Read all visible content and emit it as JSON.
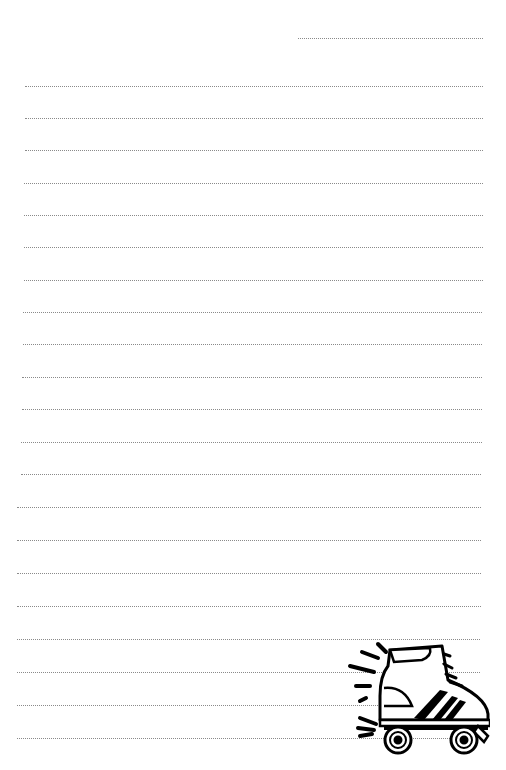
{
  "page": {
    "type": "lined-notepaper",
    "background": "#ffffff",
    "line_color": "#8a8a8a",
    "line_style": "dotted"
  },
  "header_line": {
    "x1": 298,
    "x2": 483,
    "y": 38
  },
  "lines": [
    {
      "y": 86,
      "x1": 25,
      "x2": 483
    },
    {
      "y": 118,
      "x1": 25,
      "x2": 483
    },
    {
      "y": 150,
      "x1": 25,
      "x2": 483
    },
    {
      "y": 183,
      "x1": 24,
      "x2": 483
    },
    {
      "y": 215,
      "x1": 24,
      "x2": 483
    },
    {
      "y": 247,
      "x1": 24,
      "x2": 483
    },
    {
      "y": 280,
      "x1": 24,
      "x2": 483
    },
    {
      "y": 312,
      "x1": 23,
      "x2": 482
    },
    {
      "y": 344,
      "x1": 23,
      "x2": 482
    },
    {
      "y": 377,
      "x1": 22,
      "x2": 482
    },
    {
      "y": 409,
      "x1": 22,
      "x2": 482
    },
    {
      "y": 442,
      "x1": 21,
      "x2": 482
    },
    {
      "y": 474,
      "x1": 21,
      "x2": 481
    },
    {
      "y": 507,
      "x1": 17,
      "x2": 481
    },
    {
      "y": 540,
      "x1": 17,
      "x2": 481
    },
    {
      "y": 573,
      "x1": 17,
      "x2": 481
    },
    {
      "y": 606,
      "x1": 17,
      "x2": 481
    },
    {
      "y": 639,
      "x1": 17,
      "x2": 480
    },
    {
      "y": 672,
      "x1": 17,
      "x2": 480
    },
    {
      "y": 705,
      "x1": 17,
      "x2": 480
    },
    {
      "y": 738,
      "x1": 17,
      "x2": 480
    }
  ],
  "illustration": {
    "name": "roller-skate",
    "position": "bottom-right"
  }
}
